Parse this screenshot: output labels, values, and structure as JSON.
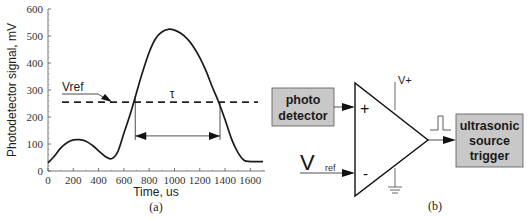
{
  "chart_data": {
    "type": "line",
    "title": "",
    "xlabel": "Time, us",
    "ylabel": "Photodetector signal, mV",
    "xlim": [
      0,
      1700
    ],
    "ylim": [
      0,
      600
    ],
    "x_ticks": [
      0,
      200,
      400,
      600,
      800,
      1000,
      1200,
      1400,
      1600
    ],
    "y_ticks": [
      0,
      100,
      200,
      300,
      400,
      500,
      600
    ],
    "x_tick_labels": [
      "0",
      "200",
      "400",
      "600",
      "800",
      "1000",
      "1200",
      "1400",
      "1600"
    ],
    "y_tick_labels": [
      "0",
      "100",
      "200",
      "300",
      "400",
      "500",
      "600"
    ],
    "grid": false,
    "series": [
      {
        "name": "Photodetector signal",
        "x": [
          0,
          50,
          100,
          150,
          200,
          250,
          300,
          350,
          400,
          450,
          500,
          550,
          600,
          650,
          700,
          750,
          800,
          850,
          900,
          950,
          1000,
          1050,
          1100,
          1150,
          1200,
          1250,
          1300,
          1350,
          1400,
          1450,
          1500,
          1550,
          1600,
          1650,
          1700
        ],
        "values": [
          30,
          55,
          85,
          105,
          115,
          116,
          110,
          95,
          75,
          55,
          45,
          70,
          140,
          210,
          290,
          370,
          440,
          490,
          515,
          525,
          522,
          510,
          490,
          460,
          420,
          370,
          310,
          255,
          190,
          120,
          70,
          40,
          35,
          35,
          35
        ]
      }
    ],
    "reference_line": {
      "label": "Vref",
      "value": 255,
      "style": "dashed"
    },
    "annotations": [
      {
        "text": "Vref",
        "type": "arrow-label",
        "points_to": [
          500,
          255
        ]
      },
      {
        "text": "τ",
        "type": "double-arrow",
        "x_start": 690,
        "x_end": 1360,
        "y": 130
      }
    ],
    "caption": "(a)"
  },
  "diagram": {
    "caption": "(b)",
    "photo_detector_label_line1": "photo",
    "photo_detector_label_line2": "detector",
    "vref_main": "V",
    "vref_sub": "ref",
    "plus_sign": "+",
    "minus_sign": "-",
    "supply_label": "V+",
    "output_label_line1": "ultrasonic",
    "output_label_line2": "source",
    "output_label_line3": "trigger",
    "box_fill": "#c8c8c8"
  }
}
